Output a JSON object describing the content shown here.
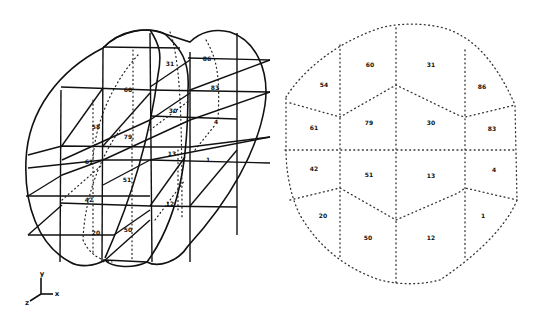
{
  "figure": {
    "left_view": {
      "description": "3D isometric wireframe of cylindrical mesh with element numbers",
      "labels": [
        {
          "id": "31",
          "x": 170,
          "y": 66
        },
        {
          "id": "86",
          "x": 207,
          "y": 61
        },
        {
          "id": "60",
          "x": 128,
          "y": 92
        },
        {
          "id": "83",
          "x": 215,
          "y": 90
        },
        {
          "id": "58",
          "x": 96,
          "y": 129
        },
        {
          "id": "30",
          "x": 173,
          "y": 113
        },
        {
          "id": "4",
          "x": 216,
          "y": 124
        },
        {
          "id": "79",
          "x": 128,
          "y": 139
        },
        {
          "id": "61",
          "x": 89,
          "y": 164
        },
        {
          "id": "13",
          "x": 172,
          "y": 156
        },
        {
          "id": "1",
          "x": 208,
          "y": 162
        },
        {
          "id": "51",
          "x": 127,
          "y": 182
        },
        {
          "id": "42",
          "x": 89,
          "y": 202
        },
        {
          "id": "12",
          "x": 170,
          "y": 206
        },
        {
          "id": "20",
          "x": 96,
          "y": 235
        },
        {
          "id": "50",
          "x": 128,
          "y": 232
        }
      ]
    },
    "right_view": {
      "description": "2D cross-section mesh (dotted) with element numbers",
      "labels": [
        {
          "id": "60",
          "x": 370,
          "y": 67
        },
        {
          "id": "31",
          "x": 431,
          "y": 67
        },
        {
          "id": "54",
          "x": 324,
          "y": 87
        },
        {
          "id": "86",
          "x": 482,
          "y": 89
        },
        {
          "id": "61",
          "x": 314,
          "y": 130
        },
        {
          "id": "79",
          "x": 369,
          "y": 125
        },
        {
          "id": "30",
          "x": 431,
          "y": 125
        },
        {
          "id": "83",
          "x": 492,
          "y": 131
        },
        {
          "id": "42",
          "x": 314,
          "y": 171
        },
        {
          "id": "51",
          "x": 369,
          "y": 177
        },
        {
          "id": "13",
          "x": 431,
          "y": 178
        },
        {
          "id": "4",
          "x": 494,
          "y": 172
        },
        {
          "id": "20",
          "x": 323,
          "y": 218
        },
        {
          "id": "50",
          "x": 368,
          "y": 240
        },
        {
          "id": "12",
          "x": 431,
          "y": 240
        },
        {
          "id": "1",
          "x": 483,
          "y": 218
        }
      ]
    },
    "axes_triad": {
      "y_label": "y",
      "x_label": "x",
      "z_label": "z"
    }
  }
}
